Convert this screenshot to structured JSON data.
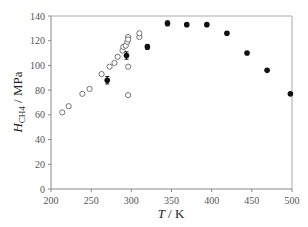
{
  "chart_data": {
    "type": "scatter",
    "title": "",
    "xlabel": "T / K",
    "xlabel_var": "T",
    "xlabel_unit": " / K",
    "ylabel": "H_CH4 / MPa",
    "ylabel_var": "H",
    "ylabel_sub": "CH4",
    "ylabel_unit": " / MPa",
    "xlim": [
      200,
      500
    ],
    "ylim": [
      0,
      140
    ],
    "xticks": [
      200,
      250,
      300,
      350,
      400,
      450,
      500
    ],
    "yticks": [
      0,
      20,
      40,
      60,
      80,
      100,
      120,
      140
    ],
    "grid": false,
    "legend": "none",
    "series": [
      {
        "name": "open circles",
        "marker": "open-circle",
        "x": [
          214,
          222,
          239,
          248,
          263,
          273,
          279,
          283,
          289,
          290,
          293,
          295,
          296,
          296,
          296,
          296,
          310,
          310
        ],
        "y": [
          62,
          67,
          77,
          81,
          93,
          99,
          102,
          107,
          112,
          115,
          116,
          119,
          123,
          121,
          99,
          76,
          123,
          126
        ]
      },
      {
        "name": "filled circles",
        "marker": "filled-circle",
        "x": [
          270,
          294,
          320,
          345,
          369,
          394,
          419,
          444,
          469,
          498
        ],
        "y": [
          88,
          108,
          115,
          134,
          133,
          133,
          126,
          110,
          96,
          77
        ],
        "error_bars": [
          3,
          3,
          2,
          2,
          1,
          1,
          1,
          1,
          1,
          1
        ]
      }
    ]
  }
}
